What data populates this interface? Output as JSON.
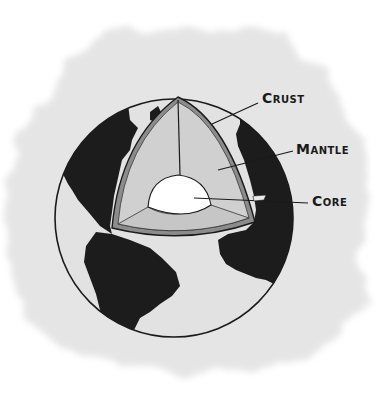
{
  "diagram": {
    "labels": [
      {
        "id": "crust",
        "text": "Crust"
      },
      {
        "id": "mantle",
        "text": "Mantle"
      },
      {
        "id": "core",
        "text": "Core"
      }
    ],
    "colors": {
      "background_wash": "#e6e6e6",
      "ocean": "#e3e3e3",
      "land": "#1c1c1c",
      "mantle": "#cfcfcf",
      "crust": "#8a8a8a",
      "core": "#ffffff",
      "outline": "#1a1a1a"
    }
  }
}
